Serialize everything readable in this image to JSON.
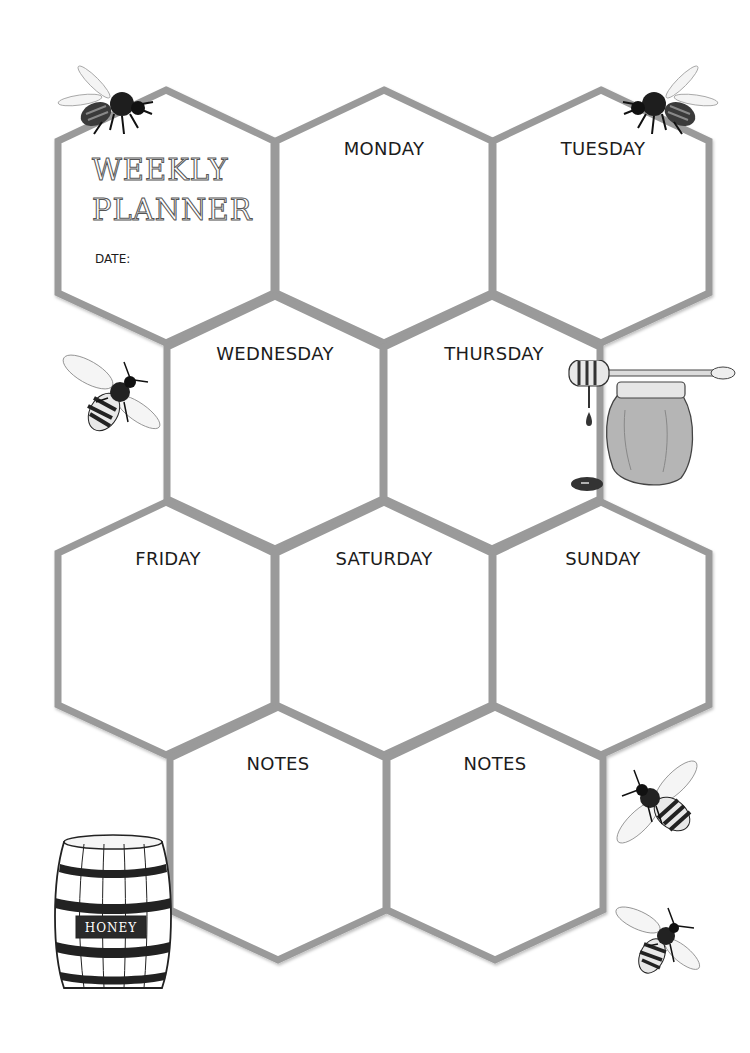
{
  "planner": {
    "title_line1": "WEEKLY",
    "title_line2": "PLANNER",
    "date_label": "DATE:"
  },
  "cells": [
    {
      "id": "title",
      "label": ""
    },
    {
      "id": "monday",
      "label": "MONDAY"
    },
    {
      "id": "tuesday",
      "label": "TUESDAY"
    },
    {
      "id": "wednesday",
      "label": "WEDNESDAY"
    },
    {
      "id": "thursday",
      "label": "THURSDAY"
    },
    {
      "id": "friday",
      "label": "FRIDAY"
    },
    {
      "id": "saturday",
      "label": "SATURDAY"
    },
    {
      "id": "sunday",
      "label": "SUNDAY"
    },
    {
      "id": "notes1",
      "label": "NOTES"
    },
    {
      "id": "notes2",
      "label": "NOTES"
    }
  ],
  "decorations": {
    "barrel_label": "HONEY",
    "items": [
      "bee-top-left",
      "bee-top-right",
      "bee-left",
      "honey-jar-with-dipper",
      "honey-barrel",
      "bee-bottom-right-1",
      "bee-bottom-right-2"
    ]
  },
  "colors": {
    "hex_outline": "#9a9a9a",
    "background": "#ffffff",
    "text": "#1c1c1c",
    "honey": "#b5b5b5"
  }
}
